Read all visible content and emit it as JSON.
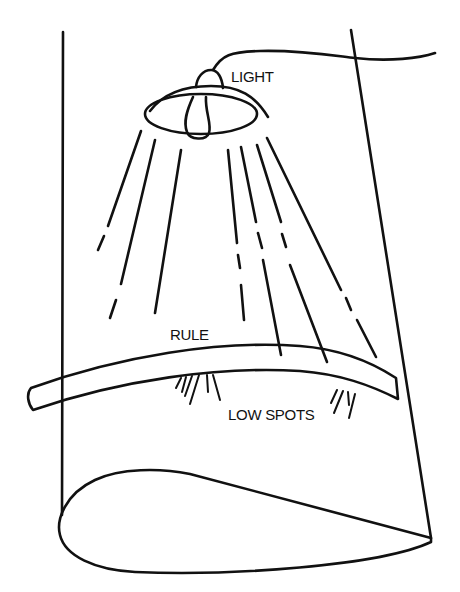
{
  "diagram": {
    "labels": {
      "light": "LIGHT",
      "rule": "RULE",
      "low_spots": "LOW SPOTS"
    },
    "colors": {
      "ink": "#111111",
      "background": "#ffffff"
    }
  }
}
